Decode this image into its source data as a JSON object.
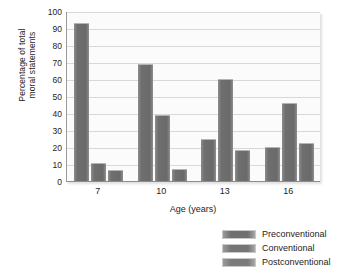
{
  "chart_data": {
    "type": "bar",
    "title": "",
    "xlabel": "Age (years)",
    "ylabel": "Percentage of total moral statements",
    "ylabel_line1": "Percentage of total",
    "ylabel_line2": "moral statements",
    "categories": [
      "7",
      "10",
      "13",
      "16"
    ],
    "ylim": [
      0,
      100
    ],
    "ytick_values": [
      0,
      10,
      20,
      30,
      40,
      50,
      60,
      70,
      80,
      90,
      100
    ],
    "ytick_labels": [
      "0",
      "10",
      "20",
      "30",
      "40",
      "50",
      "60",
      "70",
      "80",
      "90",
      "100"
    ],
    "grid": true,
    "legend_position": "below-right",
    "series": [
      {
        "name": "Preconventional",
        "values": [
          93,
          69,
          25,
          20
        ],
        "color": "#6f6f6f"
      },
      {
        "name": "Conventional",
        "values": [
          10.5,
          39,
          60,
          46
        ],
        "color": "#757575"
      },
      {
        "name": "Postconventional",
        "values": [
          6.5,
          7,
          18.5,
          22.5
        ],
        "color": "#7b7b7b"
      }
    ]
  },
  "legend": {
    "items": [
      {
        "label": "Preconventional"
      },
      {
        "label": "Conventional"
      },
      {
        "label": "Postconventional"
      }
    ]
  }
}
